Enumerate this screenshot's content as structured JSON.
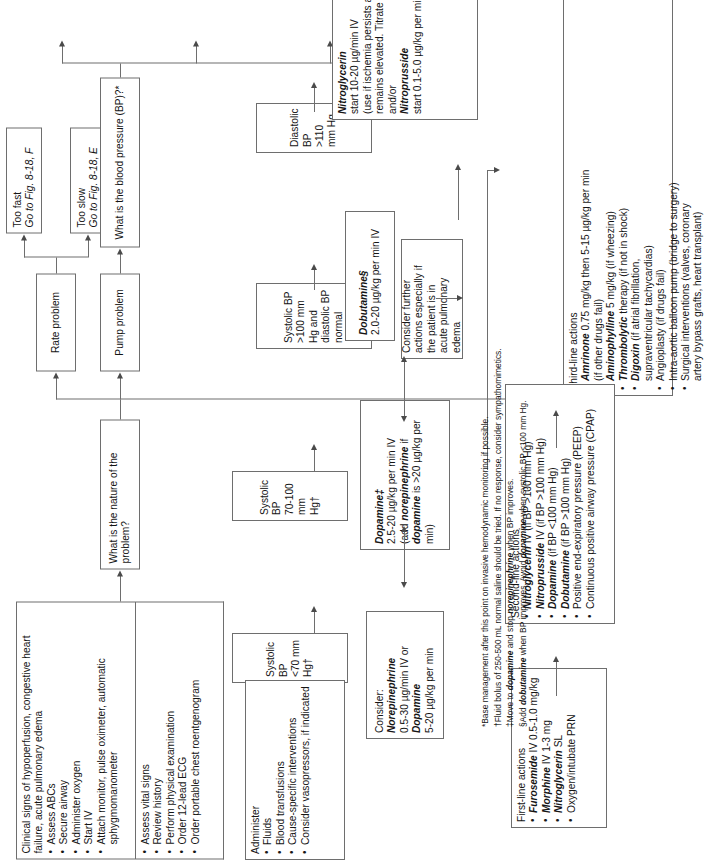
{
  "nodes": {
    "clinical_signs": {
      "heading": "Clinical signs of hypoperfusion, congestive heart failure, acute pulmonary edema",
      "items": [
        "Assess ABCs",
        "Secure airway",
        "Administer oxygen",
        "Start IV",
        "Attach monitor, pulse oximeter, automatic sphygmomanometer"
      ]
    },
    "assess_list": {
      "items": [
        "Assess vital signs",
        "Review history",
        "Perform physical examination",
        "Order 12-lead ECG",
        "Order portable chest roentgenogram"
      ]
    },
    "nature": {
      "label": "What is the nature of the problem?"
    },
    "volume_problem": {
      "label": "Volume problem"
    },
    "pump_problem": {
      "label": "Pump problem"
    },
    "rate_problem": {
      "label": "Rate problem"
    },
    "administer": {
      "heading": "Administer",
      "items": [
        "Fluids",
        "Blood transfusions",
        "Cause-specific interventions",
        "Consider vasopressors, if indicated"
      ]
    },
    "too_slow": {
      "line1": "Too slow",
      "line2": "Go to Fig. 8-18, E"
    },
    "too_fast": {
      "line1": "Too fast",
      "line2": "Go to Fig. 8-18, F"
    },
    "bp_question": {
      "label": "What is the blood pressure (BP)?*"
    },
    "bp_lt70": {
      "line1": "Systolic BP",
      "line2": "<70 mm Hg†"
    },
    "bp_70_100": {
      "line1": "Systolic BP",
      "line2": "70-100 mm Hg†"
    },
    "bp_gt100": {
      "line1": "Systolic BP",
      "line2": ">100 mm Hg and",
      "line3": "diastolic BP normal"
    },
    "bp_diastolic": {
      "line1": "Diastolic BP",
      "line2": ">110 mm Hg"
    },
    "consider_norepi": {
      "heading": "Consider:",
      "drug1": "Norepinephrine",
      "dose1": "0.5-30 µg/min IV or",
      "drug2": "Dopamine",
      "dose2": "5-20 µg/kg per min"
    },
    "dopamine": {
      "drug": "Dopamine‡",
      "dose": "2.5-20 µg/kg per min IV",
      "note_pre": "(add ",
      "note_drug": "norepinephrine",
      "note_mid": " if ",
      "note_drug2": "dopamine",
      "note_post": " is >20 µg/kg per min)"
    },
    "dobutamine": {
      "drug": "Dobutamine§",
      "dose": "2.0-20 µg/kg per min IV"
    },
    "nitro": {
      "drug1": "Nitroglycerin",
      "dose1": "start 10-20 µg/min IV",
      "note1": "(use if ischemia persists and BP",
      "note2": "remains elevated. Titrate to effect)",
      "andor": "and/or",
      "drug2": "Nitroprusside",
      "dose2": "start 0.1-5.0 µg/kg per min IV"
    },
    "consider_further": {
      "line1": "Consider further",
      "line2": "actions especially if",
      "line3": "the patient is in",
      "line4": "acute pulmonary edema"
    },
    "first_line": {
      "heading": "First-line actions",
      "items": [
        {
          "drug": "Furosemide",
          "rest": " IV 0.5-1.0 mg/kg"
        },
        {
          "drug": "Morphine",
          "rest": " IV 1-3 mg"
        },
        {
          "drug": "Nitroglycerin",
          "rest": " SL"
        },
        {
          "drug": "",
          "rest": "Oxygen/intubate PRN"
        }
      ]
    },
    "second_line": {
      "heading": "Second-line actions",
      "items": [
        {
          "drug": "Nitroglycerin",
          "rest": " IV (if BP >100 mm Hg)"
        },
        {
          "drug": "Nitroprusside",
          "rest": " IV (if BP >100 mm Hg)"
        },
        {
          "drug": "Dopamine",
          "rest": " (if BP <100 mm Hg)"
        },
        {
          "drug": "Dobutamine",
          "rest": " (if BP >100 mm Hg)"
        },
        {
          "drug": "",
          "rest": "Positive end-expiratory pressure (PEEP)"
        },
        {
          "drug": "",
          "rest": "Continuous positive airway pressure (CPAP)"
        }
      ]
    },
    "third_line": {
      "heading": "Third-line actions",
      "items": [
        {
          "drug": "Amrinone",
          "rest": " 0.75 mg/kg then 5-15 µg/kg per min",
          "rest2": "(if other drugs fail)"
        },
        {
          "drug": "Aminophylline",
          "rest": " 5 mg/kg (if wheezing)",
          "rest2": ""
        },
        {
          "drug": "Thrombolytic",
          "rest": " therapy (if not in shock)",
          "rest2": ""
        },
        {
          "drug": "Digoxin",
          "rest": " (if atrial fibrillation,",
          "rest2": "supraventricular tachycardias)"
        },
        {
          "drug": "",
          "rest": "Angioplasty (if drugs fail)",
          "rest2": ""
        },
        {
          "drug": "",
          "rest": "Intra-aortic balloon pump (bridge to surgery)",
          "rest2": ""
        },
        {
          "drug": "",
          "rest": "Surgical interventions (valves, coronary",
          "rest2": "artery bypass grafts, heart transplant)"
        }
      ]
    }
  },
  "footnotes": [
    {
      "mark": "*",
      "pre": "Base management after this point on invasive hemodynamic monitoring if possible.",
      "b1": "",
      "mid": "",
      "b2": "",
      "post": ""
    },
    {
      "mark": "†",
      "pre": "Fluid bolus of 250-500 mL normal saline should be tried. If no response, consider sympathomimetics.",
      "b1": "",
      "mid": "",
      "b2": "",
      "post": ""
    },
    {
      "mark": "‡",
      "pre": "Move to ",
      "b1": "dopamine",
      "mid": " and stop ",
      "b2": "norepinephrine",
      "post": " when BP improves."
    },
    {
      "mark": "§",
      "pre": "Add ",
      "b1": "dobutamine",
      "mid": " when BP improves. Avoid ",
      "b2": "dopamine",
      "post": " when systolic BP <100 mm Hg."
    }
  ],
  "colors": {
    "border": "#6e6e6e",
    "arrow": "#4a4a4a",
    "text": "#151515",
    "background": "#ffffff"
  }
}
